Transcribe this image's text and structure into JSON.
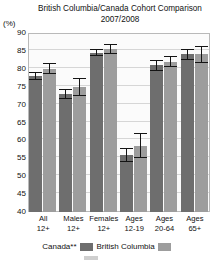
{
  "title": {
    "line1": "British Columbia/Canada Cohort Comparison",
    "line2": "2007/2008"
  },
  "unit_label": "(%)",
  "legend": {
    "canada_label": "Canada**",
    "bc_label": "British Columbia"
  },
  "colors": {
    "canada": "#6e6e6e",
    "british_columbia": "#9d9d9d",
    "error_bar": "#141414",
    "grid": "#d6d6d6",
    "plot_border": "#b9b9b9",
    "plot_background": "#fbfbfb"
  },
  "chart_data": {
    "type": "bar",
    "title": "British Columbia/Canada Cohort Comparison 2007/2008",
    "subtitle": "2007/2008",
    "xlabel": "",
    "ylabel": "(%)",
    "ylim": [
      40,
      90
    ],
    "yticks": [
      40,
      45,
      50,
      55,
      60,
      65,
      70,
      75,
      80,
      85,
      90
    ],
    "ytick_labels": [
      "40",
      "45",
      "50",
      "55",
      "60",
      "65",
      "70",
      "75",
      "80",
      "85",
      "90"
    ],
    "grid": true,
    "legend_position": "bottom",
    "categories": [
      "All 12+",
      "Males 12+",
      "Females 12+",
      "Ages 12-19",
      "Ages 20-64",
      "Ages 65+"
    ],
    "category_lines": [
      [
        "All",
        "12+"
      ],
      [
        "Males",
        "12+"
      ],
      [
        "Females",
        "12+"
      ],
      [
        "Ages",
        "12-19"
      ],
      [
        "Ages",
        "20-64"
      ],
      [
        "Ages",
        "65+"
      ]
    ],
    "series": [
      {
        "name": "Canada**",
        "color": "#6e6e6e",
        "values": [
          78.0,
          73.0,
          84.5,
          56.0,
          81.0,
          84.0
        ],
        "errors": [
          1.0,
          1.5,
          1.0,
          2.0,
          1.5,
          1.5
        ]
      },
      {
        "name": "British Columbia",
        "color": "#9d9d9d",
        "values": [
          80.0,
          75.0,
          85.5,
          58.5,
          82.0,
          84.0
        ],
        "errors": [
          1.5,
          2.5,
          1.5,
          3.5,
          1.5,
          2.5
        ]
      }
    ]
  }
}
